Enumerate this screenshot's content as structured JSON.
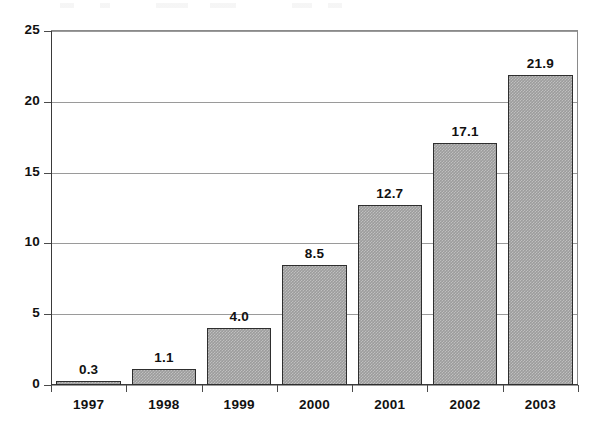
{
  "chart_data": {
    "type": "bar",
    "title": "",
    "subtitle": "",
    "xlabel": "",
    "ylabel": "",
    "categories": [
      "1997",
      "1998",
      "1999",
      "2000",
      "2001",
      "2002",
      "2003"
    ],
    "values": [
      0.3,
      1.1,
      4.0,
      8.5,
      12.7,
      17.1,
      21.9
    ],
    "value_labels": [
      "0.3",
      "1.1",
      "4.0",
      "8.5",
      "12.7",
      "17.1",
      "21.9"
    ],
    "ylim": [
      0,
      25
    ],
    "ytick_values": [
      0,
      5,
      10,
      15,
      20,
      25
    ],
    "ytick_labels": [
      "0",
      "5",
      "10",
      "15",
      "20",
      "25"
    ],
    "grid": "horizontal",
    "legend": "none",
    "series": [
      {
        "name": "",
        "values": [
          0.3,
          1.1,
          4.0,
          8.5,
          12.7,
          17.1,
          21.9
        ]
      }
    ],
    "colors": {
      "bar_fill": "#9c9c9c",
      "bar_border": "#2e2e2e",
      "gridline": "#9a9a9a",
      "axis": "#3a3a3a",
      "text": "#111111",
      "background": "#ffffff"
    }
  }
}
